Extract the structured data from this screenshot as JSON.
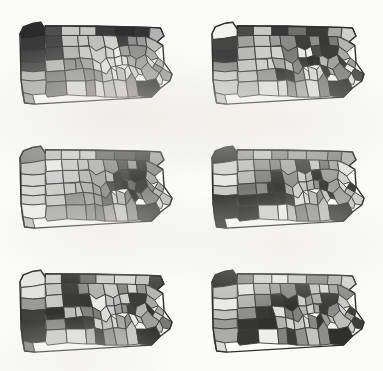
{
  "figure": {
    "title": "",
    "subtitle": "",
    "background_color": "#fbfbf9",
    "panel_rows": 3,
    "panel_columns": 2,
    "total_panels": 6,
    "map_subject": "Pennsylvania counties",
    "county_count": 67,
    "border_color": "#3a3a3a",
    "outline_color": "#2e2e2e"
  },
  "legend": {
    "visible": false,
    "palette_name": "grayscale-6",
    "swatches": [
      {
        "level": 1,
        "color": "#2b2b2b",
        "label": ""
      },
      {
        "level": 2,
        "color": "#4f4f4f",
        "label": ""
      },
      {
        "level": 3,
        "color": "#757575",
        "label": ""
      },
      {
        "level": 4,
        "color": "#9a9a9a",
        "label": ""
      },
      {
        "level": 5,
        "color": "#c0c0c0",
        "label": ""
      },
      {
        "level": 6,
        "color": "#e6e6e4",
        "label": ""
      }
    ]
  },
  "counties": [
    "Erie",
    "Warren",
    "McKean",
    "Potter",
    "Tioga",
    "Bradford",
    "Susquehanna",
    "Wayne",
    "Crawford",
    "Forest",
    "Elk",
    "Cameron",
    "Clinton",
    "Lycoming",
    "Sullivan",
    "Wyoming",
    "Lackawanna",
    "Pike",
    "Mercer",
    "Venango",
    "Jefferson",
    "Clearfield",
    "Centre",
    "Union",
    "Montour",
    "Columbia",
    "Luzerne",
    "Monroe",
    "Lawrence",
    "Butler",
    "Clarion",
    "Armstrong",
    "Indiana",
    "Blair",
    "Huntingdon",
    "Mifflin",
    "Juniata",
    "Snyder",
    "Northumberland",
    "Schuylkill",
    "Carbon",
    "Northampton",
    "Lehigh",
    "Beaver",
    "Allegheny",
    "Westmoreland",
    "Cambria",
    "Somerset",
    "Bedford",
    "Fulton",
    "Franklin",
    "Perry",
    "Dauphin",
    "Lebanon",
    "Berks",
    "Bucks",
    "Montgomery",
    "Washington",
    "Greene",
    "Fayette",
    "Cumberland",
    "Adams",
    "York",
    "Lancaster",
    "Chester",
    "Delaware",
    "Philadelphia"
  ],
  "chart_data": {
    "type": "heatmap",
    "title": "",
    "xlabel": "",
    "ylabel": "",
    "panels": [
      {
        "index": 0,
        "row": 1,
        "column": 1,
        "caption": "",
        "fills": [
          "#2b2b2b",
          "#4f4f4f",
          "#c8c8c6",
          "#c4c4c2",
          "#3b3b3b",
          "#2e2e2e",
          "#343434",
          "#b2b2b2",
          "#3a3a3a",
          "#4a4a4a",
          "#c2c2c0",
          "#c6c6c4",
          "#bdbdbb",
          "#cfcfcd",
          "#3f3f3f",
          "#8d8d8d",
          "#9a9a9a",
          "#b8b8b6",
          "#434343",
          "#494949",
          "#b4b4b2",
          "#c9c9c7",
          "#cccccA",
          "#d2d2d0",
          "#ececea",
          "#9c9c9a",
          "#8b8b89",
          "#a6a6a4",
          "#4d4d4d",
          "#b7b7b5",
          "#8e8e8c",
          "#8a8a88",
          "#9f9f9d",
          "#d4d4d2",
          "#e0e0de",
          "#dcdcda",
          "#ebebe9",
          "#e2e2e0",
          "#a8a8a6",
          "#9d9d9b",
          "#d6d6d4",
          "#b0b0ae",
          "#8f8f8d",
          "#b5b5b3",
          "#7e7e7c",
          "#9b9b99",
          "#868684",
          "#8c8c8a",
          "#c1c1bf",
          "#e7e7e5",
          "#bcbcba",
          "#e4e4e2",
          "#d0d0ce",
          "#dbdbd9",
          "#a2a2a0",
          "#9e9e9c",
          "#dedede",
          "#aeaeac",
          "#a4a4a2",
          "#7b7b79",
          "#dadad8",
          "#8888 86",
          "#d8d8d6",
          "#b9b9b7",
          "#cacac8",
          "#909090",
          "#2f2f2f"
        ]
      },
      {
        "index": 1,
        "row": 1,
        "column": 2,
        "caption": "",
        "fills": [
          "#f2f2f0",
          "#4a4a48",
          "#c7c7c5",
          "#383838",
          "#6f6f6d",
          "#3b3b39",
          "#a6a6a4",
          "#cfcfcd",
          "#454543",
          "#a1a1 9f",
          "#c3c3c1",
          "#9e9e9c",
          "#8a8a88",
          "#3f3f3d",
          "#8d8d8b",
          "#3a3a38",
          "#7b7b79",
          "#b4b4b2",
          "#404040",
          "#b8b8b6",
          "#cbcbc9",
          "#d0d0ce",
          "#7d7d7b",
          "#e9e9e7",
          "#f0f0ee",
          "#4d4d4b",
          "#3c3c3a",
          "#a9a9a7",
          "#8f8f8d",
          "#c5c5c3",
          "#cdcdcb",
          "#d3d3d1",
          "#a3a3a1",
          "#bebebc",
          "#8686 84",
          "#3d3d3b",
          "#2f2f2d",
          "#343432",
          "#b6b6b4",
          "#a0a0 9e",
          "#454543",
          "#9c9c9a",
          "#efefed",
          "#c9c9c7",
          "#c0c0be",
          "#97979 5",
          "#313131",
          "#3636 34",
          "#8b8b89",
          "#e5e5e3",
          "#d6d6d4",
          "#d2d2d0",
          "#3e3e3c",
          "#b1b1af",
          "#8787 85",
          "#4f4f4d",
          "#dcdcda",
          "#cacac8",
          "#c6c6c4",
          "#bbbbb9",
          "#e1e1df",
          "#d9d9d7",
          "#9090 8e",
          "#abab a9",
          "#dfdfdd",
          "#8282 80",
          "#3a3a3a"
        ]
      },
      {
        "index": 2,
        "row": 2,
        "column": 1,
        "caption": "",
        "fills": [
          "#8b8b89",
          "#c3c3c1",
          "#d0d0ce",
          "#cdcdcb",
          "#6d6d6b",
          "#5a5a58",
          "#4b4b49",
          "#a7a7a5",
          "#c6c6c4",
          "#ebebe9",
          "#cacac8",
          "#c0c0be",
          "#b2b2b0",
          "#8f8f8d",
          "#56565 4",
          "#9b9b99",
          "#3c3c3a",
          "#8a8a88",
          "#d5d5d3",
          "#cecece",
          "#c9c9c7",
          "#b7b7b5",
          "#a3a3a1",
          "#b9b9b7",
          "#3f3f3d",
          "#4646 44",
          "#3434 32",
          "#a5a5a3",
          "#d8d8d6",
          "#cbcbc9",
          "#c5c5c3",
          "#bdbdbb",
          "#b0b0ae",
          "#9d9d9b",
          "#8c8c8a",
          "#5050 4e",
          "#4242 40",
          "#3838 36",
          "#6b6b69",
          "#3d3d3b",
          "#8888 86",
          "#a8a8a6",
          "#b4b4b2",
          "#d2d2d0",
          "#c7c7c5",
          "#8e8e8c",
          "#a1a1 9f",
          "#9696 94",
          "#6868 66",
          "#cfcfcd",
          "#b5b5b3",
          "#8181 7f",
          "#3131 2f",
          "#7878 76",
          "#8585 83",
          "#bcbcba",
          "#dbdbd9",
          "#eeeeec",
          "#c2c2c0",
          "#aaaa a8",
          "#9f9f9d",
          "#8d8d8b",
          "#7f7f7d",
          "#a4a4a2",
          "#c8c8c6",
          "#9292 90",
          "#4949 47"
        ]
      },
      {
        "index": 3,
        "row": 2,
        "column": 2,
        "caption": "",
        "fills": [
          "#3b3b39",
          "#a2a2a0",
          "#c4c4c2",
          "#8e8e8c",
          "#a9a9a7",
          "#9f9f9d",
          "#8b8b89",
          "#b0b0ae",
          "#d4d4d2",
          "#c1c1bf",
          "#9898 96",
          "#8787 85",
          "#ababa9",
          "#4545 43",
          "#c7c7c5",
          "#7d7d7b",
          "#a6a6a4",
          "#e4e4e2",
          "#e8e8e6",
          "#b8b8b6",
          "#8282 80",
          "#3636 34",
          "#8f8f8d",
          "#cbcbc9",
          "#b4b4b2",
          "#3232 30",
          "#9c9c9a",
          "#cfcfcd",
          "#c9c9c7",
          "#7575 73",
          "#8989 87",
          "#3939 37",
          "#3434 32",
          "#a7a7a5",
          "#d0d0ce",
          "#c6c6c4",
          "#b2b2b0",
          "#9191 8f",
          "#3d3d3b",
          "#a0a0 9e",
          "#d8d8d6",
          "#3f3f3d",
          "#b6b6b4",
          "#3737 35",
          "#3030 2e",
          "#3232 30",
          "#3535 33",
          "#4242 40",
          "#e0e0de",
          "#dcdcda",
          "#b9b9b7",
          "#8c8c8a",
          "#c3c3c1",
          "#3c3c3a",
          "#a4a4a2",
          "#cdcdcb",
          "#cacac8",
          "#3838 36",
          "#3434 32",
          "#2f2f2d",
          "#d2d2d0",
          "#ededeb",
          "#bdbdbb",
          "#8585 83",
          "#9a9a98",
          "#c0c0be",
          "#4747 45"
        ]
      },
      {
        "index": 4,
        "row": 3,
        "column": 1,
        "caption": "",
        "fills": [
          "#e6e6e4",
          "#d2d2d0",
          "#3434 32",
          "#6f6f6d",
          "#cdcdcb",
          "#d8d8d6",
          "#c0c0be",
          "#4848 46",
          "#e2e2e0",
          "#c5c5c3",
          "#4040 3e",
          "#8d8d8b",
          "#b1b1af",
          "#cacac8",
          "#8787 85",
          "#d4d4d2",
          "#9595 93",
          "#b6b6b4",
          "#9a9a98",
          "#c8c8c6",
          "#3a3a38",
          "#3636 34",
          "#eaeae8",
          "#c2c2c0",
          "#bababb",
          "#d0d0ce",
          "#3d3d3b",
          "#a8a8a6",
          "#3f3f3d",
          "#3232 30",
          "#bcbcba",
          "#c6c6c4",
          "#8181 7f",
          "#7b7b79",
          "#dcdcda",
          "#cecece",
          "#9f9f9d",
          "#8b8b89",
          "#4343 41",
          "#b4b4b2",
          "#3535 33",
          "#ababa9",
          "#c3c3c1",
          "#3838 36",
          "#8989 87",
          "#3131 2f",
          "#3c3c3a",
          "#cfcfcd",
          "#bebebc",
          "#d6d6d4",
          "#a3a3a1",
          "#8f8f8d",
          "#e8e8e6",
          "#c1c1bf",
          "#9e9e9c",
          "#7878 76",
          "#b8b8b6",
          "#3939 37",
          "#8484 82",
          "#cbcbc9",
          "#dedede",
          "#b2b2b0",
          "#3e3e3c",
          "#9292 90",
          "#a6a6a4",
          "#c7c7c5",
          "#3030 2e"
        ]
      },
      {
        "index": 5,
        "row": 3,
        "column": 2,
        "caption": "",
        "fills": [
          "#3232 30",
          "#8e8e8c",
          "#d6d6d4",
          "#ededeb",
          "#cacac8",
          "#8a8a88",
          "#b0b0ae",
          "#d2d2d0",
          "#c0c0be",
          "#e4e4e2",
          "#b8b8b6",
          "#9f9f9d",
          "#8585 83",
          "#3a3a38",
          "#c5c5c3",
          "#d9d9d7",
          "#a2a2a0",
          "#8c8c8a",
          "#eaeae8",
          "#b4b4b2",
          "#8787 85",
          "#3636 34",
          "#3030 2e",
          "#cdcdcb",
          "#9898 96",
          "#aaaa a8",
          "#3d3d3b",
          "#c8c8c6",
          "#c2c2c0",
          "#8f8f8d",
          "#3838 36",
          "#3333 31",
          "#e0e0de",
          "#7e7e7c",
          "#8181 7f",
          "#b6b6b4",
          "#d0d0ce",
          "#a6a6a4",
          "#3c3c3a",
          "#8b8b89",
          "#cecece",
          "#3f3f3d",
          "#a0a0 9e",
          "#9a9a98",
          "#3535 33",
          "#3131 2f",
          "#b2b2b0",
          "#d4d4d2",
          "#c6c6c4",
          "#dcdcda",
          "#8989 87",
          "#3434 32",
          "#9c9c9a",
          "#c1c1bf",
          "#bdbdbb",
          "#3e3e3c",
          "#caca c8",
          "#ababa9",
          "#d8d8d6",
          "#3737 35",
          "#eeeeec",
          "#8282 80",
          "#3b3b39",
          "#9191 8f",
          "#c3c3c1",
          "#8d8d8b",
          "#2f2f2d"
        ]
      }
    ]
  }
}
